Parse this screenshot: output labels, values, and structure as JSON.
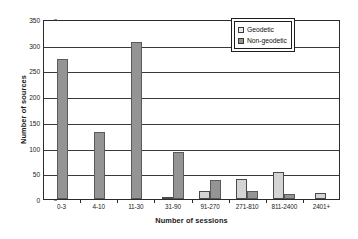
{
  "chart_data": {
    "type": "bar",
    "title": "",
    "xlabel": "Number of sessions",
    "ylabel": "Number of sources",
    "categories": [
      "0-3",
      "4-10",
      "11-30",
      "31-90",
      "91-270",
      "271-810",
      "811-2400",
      "2401+"
    ],
    "series": [
      {
        "name": "Geodetic",
        "values": [
          0,
          0,
          0,
          2,
          15,
          38,
          52,
          11
        ],
        "color": "#d4d4d4"
      },
      {
        "name": "Non-geodetic",
        "values": [
          273,
          130,
          305,
          92,
          37,
          15,
          10,
          0
        ],
        "color": "#949494"
      }
    ],
    "ylim": [
      0,
      350
    ],
    "yticks": [
      0,
      50,
      100,
      150,
      200,
      250,
      300,
      350
    ],
    "ytick_labels": [
      "0",
      "50",
      "100",
      "150",
      "200",
      "250",
      "300",
      "350"
    ],
    "grid": "horizontal",
    "legend_position": "top-right-inside"
  },
  "legend": {
    "items": [
      {
        "label": "Geodetic",
        "swatch": "geodetic-swatch"
      },
      {
        "label": "Non-geodetic",
        "swatch": "non-geodetic-swatch"
      }
    ]
  }
}
